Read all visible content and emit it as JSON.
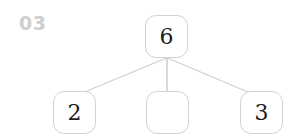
{
  "worksheet": {
    "question_number": "03",
    "background_color": "#ffffff",
    "number_label_color": "#cfcfcf",
    "box_border_color": "#d2d2d2",
    "connector_color": "#c8c8c8",
    "digit_color": "#1c1c1c"
  },
  "number_bond": {
    "root": {
      "label": "root-node",
      "value": "6",
      "empty": false
    },
    "children": [
      {
        "label": "left-child-node",
        "value": "2",
        "empty": false
      },
      {
        "label": "middle-child-node",
        "value": "",
        "empty": true
      },
      {
        "label": "right-child-node",
        "value": "3",
        "empty": false
      }
    ]
  }
}
